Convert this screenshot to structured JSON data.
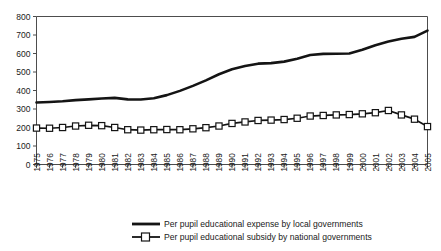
{
  "chart_data": {
    "type": "line",
    "title": "",
    "subtitle": "",
    "xlabel": "",
    "ylabel": "",
    "grid": false,
    "legend_position": "bottom-center",
    "xlim": [
      1975,
      2005
    ],
    "ylim": [
      0,
      800
    ],
    "ytick_labels": [
      "800",
      "700",
      "600",
      "500",
      "400",
      "300",
      "200",
      "100",
      "0"
    ],
    "ytick_values": [
      800,
      700,
      600,
      500,
      400,
      300,
      200,
      100,
      0
    ],
    "x": [
      1975,
      1976,
      1977,
      1978,
      1979,
      1980,
      1981,
      1982,
      1983,
      1984,
      1985,
      1986,
      1987,
      1988,
      1989,
      1990,
      1991,
      1992,
      1993,
      1994,
      1995,
      1996,
      1997,
      1998,
      1999,
      2000,
      2001,
      2002,
      2003,
      2004,
      2005
    ],
    "xtick_labels": [
      "1975",
      "1976",
      "1977",
      "1978",
      "1979",
      "1980",
      "1981",
      "1982",
      "1983",
      "1984",
      "1985",
      "1986",
      "1987",
      "1988",
      "1989",
      "1990",
      "1991",
      "1992",
      "1993",
      "1994",
      "1995",
      "1996",
      "1997",
      "1998",
      "1999",
      "2000",
      "2001",
      "2002",
      "2003",
      "2004",
      "2005"
    ],
    "series": [
      {
        "name": "Per pupil educational expense by local governments",
        "marker": "none",
        "line_width": "thick",
        "color": "#141414",
        "values": [
          335,
          338,
          342,
          348,
          352,
          357,
          360,
          352,
          351,
          358,
          375,
          398,
          425,
          455,
          488,
          515,
          532,
          545,
          548,
          556,
          572,
          592,
          598,
          599,
          600,
          620,
          645,
          665,
          680,
          690,
          724
        ]
      },
      {
        "name": "Per pupil educational subsidy by national governments",
        "marker": "open-square",
        "line_width": "medium",
        "color": "#141414",
        "values": [
          197,
          196,
          200,
          208,
          212,
          210,
          200,
          188,
          186,
          188,
          189,
          188,
          193,
          199,
          208,
          222,
          230,
          238,
          240,
          243,
          250,
          262,
          265,
          268,
          270,
          274,
          280,
          292,
          268,
          245,
          205
        ]
      }
    ]
  },
  "legend": {
    "entries": [
      {
        "label": "Per pupil educational expense by local governments",
        "marker": "line-thick"
      },
      {
        "label": "Per pupil educational subsidy by national governments",
        "marker": "line-square"
      }
    ]
  }
}
